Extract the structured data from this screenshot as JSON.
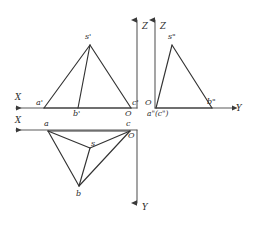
{
  "diagram": {
    "type": "engineering-drawing",
    "line_color": "#333333",
    "axis_color": "#4a4a4a",
    "background": "#ffffff",
    "axes": [
      {
        "name": "X",
        "label": "X",
        "view": "front",
        "direction": "left",
        "x": 20,
        "y": 100
      },
      {
        "name": "Z",
        "label": "Z",
        "view": "front",
        "direction": "up",
        "x": 138,
        "y": 28
      },
      {
        "name": "Z",
        "label": "Z",
        "view": "side",
        "direction": "up",
        "x": 168,
        "y": 28
      },
      {
        "name": "Y",
        "label": "Y",
        "view": "side",
        "direction": "right",
        "x": 240,
        "y": 106
      },
      {
        "name": "X",
        "label": "X",
        "view": "top",
        "direction": "left",
        "x": 20,
        "y": 122
      },
      {
        "name": "Y",
        "label": "Y",
        "view": "top",
        "direction": "down",
        "x": 137,
        "y": 208
      }
    ],
    "views": {
      "front": {
        "name": "front-view",
        "origin_label": "O",
        "vertices": [
          {
            "label": "s'",
            "x": 90,
            "y": 45
          },
          {
            "label": "a'",
            "x": 44,
            "y": 108
          },
          {
            "label": "b'",
            "x": 78,
            "y": 108
          },
          {
            "label": "c'",
            "x": 131,
            "y": 108
          }
        ]
      },
      "side": {
        "name": "side-view",
        "origin_label": "O",
        "vertices": [
          {
            "label": "s\"",
            "x": 172,
            "y": 45
          },
          {
            "label": "a\"(c\")",
            "x": 155,
            "y": 108
          },
          {
            "label": "b\"",
            "x": 212,
            "y": 108
          }
        ]
      },
      "top": {
        "name": "top-view",
        "origin_label": "O",
        "vertices": [
          {
            "label": "a",
            "x": 48,
            "y": 131
          },
          {
            "label": "b",
            "x": 79,
            "y": 186
          },
          {
            "label": "c",
            "x": 130,
            "y": 131
          },
          {
            "label": "s",
            "x": 90,
            "y": 148
          }
        ]
      }
    },
    "labels": {
      "x_front": "X",
      "x_top": "X",
      "z_front": "Z",
      "z_side": "Z",
      "y_side": "Y",
      "y_top": "Y",
      "o_front": "O",
      "o_side": "O",
      "o_top": "O",
      "s_front": "s'",
      "a_front": "a'",
      "b_front": "b'",
      "c_front": "c'",
      "s_side": "s\"",
      "ac_side": "a\"(c\")",
      "b_side": "b\"",
      "a_top": "a",
      "b_top": "b",
      "c_top": "c",
      "s_top": "s"
    }
  }
}
